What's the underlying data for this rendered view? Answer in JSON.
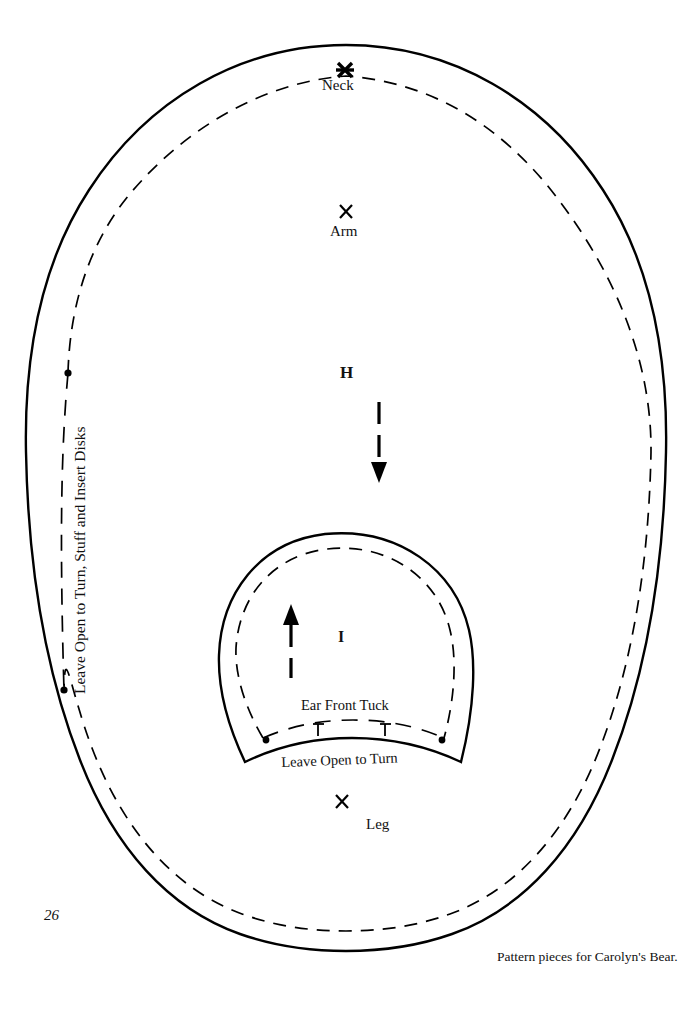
{
  "page": {
    "number": "26",
    "caption": "Pattern pieces for Carolyn's Bear.",
    "background_color": "#ffffff",
    "ink_color": "#000000"
  },
  "pattern": {
    "title": "Pattern pieces for Carolyn's Bear.",
    "pieces": [
      {
        "letter": "H",
        "shape": "egg-outline",
        "cut_line": "solid",
        "seam_line": "dashed",
        "grain_arrow_direction": "down",
        "markers": [
          {
            "name": "neck",
            "label": "Neck",
            "glyph": "bold-x",
            "position_note": "on seam line at top center"
          },
          {
            "name": "arm",
            "label": "Arm",
            "glyph": "x",
            "position_note": "upper middle"
          },
          {
            "name": "leg",
            "label": "Leg",
            "glyph": "x",
            "position_note": "lower middle"
          }
        ],
        "opening_note": "Leave Open to Turn, Stuff and Insert Disks"
      },
      {
        "letter": "I",
        "shape": "ear-dome",
        "cut_line": "solid",
        "seam_line": "dashed",
        "grain_arrow_direction": "up",
        "tuck_label": "Ear Front Tuck",
        "opening_note": "Leave Open to Turn"
      }
    ]
  },
  "labels": {
    "neck": "Neck",
    "arm": "Arm",
    "leg": "Leg",
    "piece_h": "H",
    "piece_i": "I",
    "ear_front_tuck": "Ear Front Tuck",
    "leave_open_body": "Leave Open to Turn, Stuff and Insert Disks",
    "leave_open_ear": "Leave Open to Turn"
  }
}
